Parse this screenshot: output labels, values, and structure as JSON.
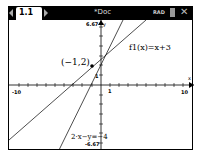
{
  "header": {
    "tab_label": "1.1",
    "doc_title": "*Doc",
    "angle_mode": "RAD",
    "icons": [
      "tab-left-arrow-icon",
      "tab-right-arrow-icon",
      "battery-icon",
      "close-icon"
    ]
  },
  "graph": {
    "xmin_label": "-10",
    "xmax_label": "10",
    "x_tick_label": "1",
    "ymax_label": "6.67",
    "ymin_label": "-6.67",
    "y_tick_label": "1",
    "x_axis_label": "x",
    "y_axis_label": "y",
    "f1_label": "f1(x)=x+3",
    "eq2_label": "2·x−y=−4",
    "point_label": "(−1,2)"
  }
}
